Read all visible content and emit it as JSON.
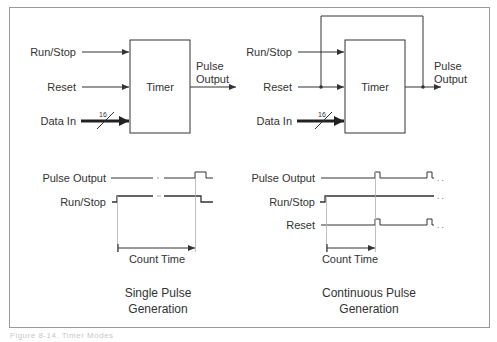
{
  "figure": {
    "caption": "Figure 8-14. Timer Modes",
    "colors": {
      "line": "#333333",
      "frame": "#9a9a9a",
      "guide": "#b0b0b0",
      "background": "#ffffff"
    }
  },
  "single": {
    "block": {
      "title": "Timer",
      "inputs": [
        "Run/Stop",
        "Reset",
        "Data In"
      ],
      "bus_width": "16",
      "output_line1": "Pulse",
      "output_line2": "Output"
    },
    "timing": {
      "signals": [
        "Pulse Output",
        "Run/Stop"
      ],
      "interval_label": "Count Time"
    },
    "caption_line1": "Single Pulse",
    "caption_line2": "Generation"
  },
  "continuous": {
    "block": {
      "title": "Timer",
      "inputs": [
        "Run/Stop",
        "Reset",
        "Data In"
      ],
      "bus_width": "16",
      "output_line1": "Pulse",
      "output_line2": "Output",
      "feedback": "Pulse Output fed back to Reset"
    },
    "timing": {
      "signals": [
        "Pulse Output",
        "Run/Stop",
        "Reset"
      ],
      "interval_label": "Count Time",
      "continuation": ". ."
    },
    "caption_line1": "Continuous Pulse",
    "caption_line2": "Generation"
  }
}
